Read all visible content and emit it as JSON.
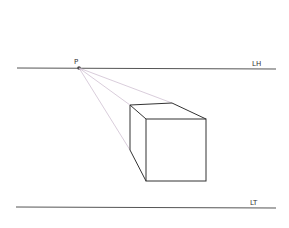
{
  "diagram": {
    "labels": {
      "vanishing_point": "P",
      "horizon_line": "LH",
      "ground_line": "LT"
    },
    "colors": {
      "line": "#555555",
      "construction": "#c9b7cc",
      "background": "#ffffff"
    }
  }
}
